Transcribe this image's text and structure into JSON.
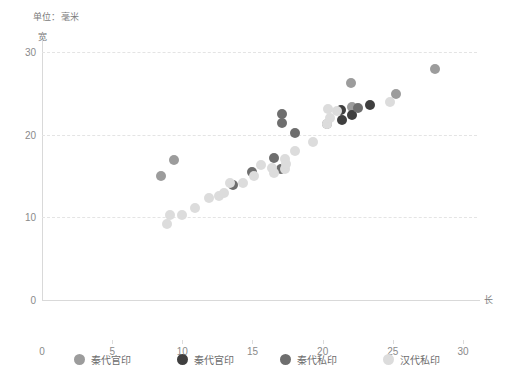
{
  "chart_data": {
    "type": "scatter",
    "title": "",
    "unit_caption": "单位：毫米",
    "xlabel": "长",
    "ylabel": "宽",
    "xlim": [
      0,
      31
    ],
    "ylim": [
      0,
      31.5
    ],
    "xticks": [
      0,
      5,
      10,
      15,
      20,
      25,
      30
    ],
    "yticks": [
      0,
      10,
      20,
      30
    ],
    "grid": "horizontal-dashed",
    "legend_position": "bottom",
    "series": [
      {
        "name": "秦代官印",
        "color": "#9c9c9c",
        "points": [
          [
            8.5,
            15.0
          ],
          [
            9.4,
            17.0
          ],
          [
            20.3,
            21.3
          ],
          [
            22.0,
            26.3
          ],
          [
            22.1,
            23.4
          ],
          [
            25.2,
            25.0
          ],
          [
            28.0,
            28.0
          ]
        ]
      },
      {
        "name": "秦代官印",
        "color": "#3f3f3f",
        "points": [
          [
            21.3,
            23.0
          ],
          [
            21.4,
            21.8
          ],
          [
            23.4,
            23.6
          ],
          [
            22.1,
            22.4
          ]
        ]
      },
      {
        "name": "秦代私印",
        "color": "#6e6e6e",
        "points": [
          [
            16.5,
            17.2
          ],
          [
            17.0,
            15.9
          ],
          [
            17.1,
            21.4
          ],
          [
            17.1,
            22.5
          ],
          [
            18.0,
            20.2
          ],
          [
            22.5,
            23.3
          ],
          [
            15.0,
            15.5
          ],
          [
            13.6,
            13.9
          ]
        ]
      },
      {
        "name": "汉代私印",
        "color": "#dcdcdc",
        "points": [
          [
            8.9,
            9.2
          ],
          [
            9.1,
            10.3
          ],
          [
            10.0,
            10.3
          ],
          [
            10.9,
            11.2
          ],
          [
            11.9,
            12.3
          ],
          [
            12.6,
            12.6
          ],
          [
            13.0,
            13.0
          ],
          [
            13.4,
            14.2
          ],
          [
            14.3,
            14.2
          ],
          [
            15.1,
            15.0
          ],
          [
            15.6,
            16.4
          ],
          [
            16.4,
            16.0
          ],
          [
            16.5,
            15.4
          ],
          [
            17.3,
            17.1
          ],
          [
            17.3,
            15.9
          ],
          [
            17.4,
            16.5
          ],
          [
            18.0,
            18.1
          ],
          [
            19.3,
            19.2
          ],
          [
            20.3,
            21.3
          ],
          [
            20.5,
            22.0
          ],
          [
            20.4,
            23.1
          ],
          [
            21.0,
            22.9
          ],
          [
            24.8,
            24.0
          ]
        ]
      }
    ]
  },
  "legend": [
    {
      "label": "秦代官印",
      "color": "#9c9c9c"
    },
    {
      "label": "秦代官印",
      "color": "#3f3f3f"
    },
    {
      "label": "秦代私印",
      "color": "#6e6e6e"
    },
    {
      "label": "汉代私印",
      "color": "#dcdcdc"
    }
  ]
}
